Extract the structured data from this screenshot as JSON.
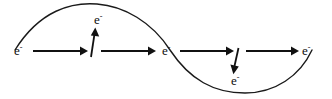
{
  "figure": {
    "background_color": "#ffffff",
    "stroke_color": "#111111",
    "width": 332,
    "height": 99
  },
  "labels": [
    {
      "id": "electron-left",
      "text": "e",
      "charge": "-",
      "x": 14,
      "y": 44,
      "position": "curve-start-left"
    },
    {
      "id": "electron-top",
      "text": "e",
      "charge": "-",
      "x": 94,
      "y": 13,
      "position": "above-up-arrow"
    },
    {
      "id": "electron-center",
      "text": "e",
      "charge": "-",
      "x": 162,
      "y": 44,
      "position": "curve-zero-crossing"
    },
    {
      "id": "electron-bottom",
      "text": "e",
      "charge": "-",
      "x": 231,
      "y": 74,
      "position": "below-down-arrow"
    },
    {
      "id": "electron-right",
      "text": "e",
      "charge": "-",
      "x": 302,
      "y": 44,
      "position": "curve-end-right"
    }
  ],
  "arrows": [
    {
      "id": "arrow-right-1",
      "direction": "right",
      "x1": 33,
      "y1": 51,
      "x2": 86,
      "y2": 51
    },
    {
      "id": "arrow-up-1",
      "direction": "up",
      "x1": 91,
      "y1": 57,
      "x2": 95,
      "y2": 29
    },
    {
      "id": "arrow-right-2",
      "direction": "right",
      "x1": 101,
      "y1": 51,
      "x2": 155,
      "y2": 51
    },
    {
      "id": "arrow-right-3",
      "direction": "right",
      "x1": 180,
      "y1": 51,
      "x2": 233,
      "y2": 51
    },
    {
      "id": "arrow-down-1",
      "direction": "down",
      "x1": 238,
      "y1": 48,
      "x2": 233,
      "y2": 74
    },
    {
      "id": "arrow-right-4",
      "direction": "right",
      "x1": 246,
      "y1": 51,
      "x2": 299,
      "y2": 51
    }
  ],
  "wave": {
    "id": "sine-wave",
    "description": "single-cycle sinusoid crest left, trough right",
    "start": {
      "x": 15,
      "y": 50
    },
    "crest": {
      "x": 97,
      "y": 4
    },
    "zero_crossing": {
      "x": 170,
      "y": 50
    },
    "trough": {
      "x": 245,
      "y": 93
    },
    "end": {
      "x": 312,
      "y": 50
    }
  }
}
